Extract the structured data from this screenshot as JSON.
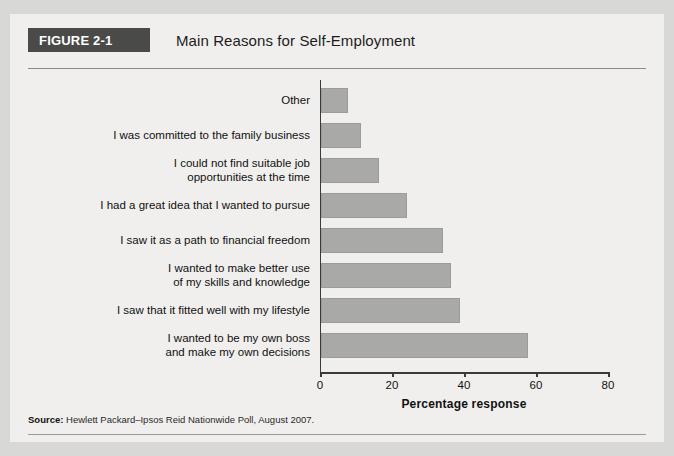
{
  "figure": {
    "badge_label": "FIGURE 2-1",
    "title": "Main Reasons for Self-Employment",
    "source_label": "Source:",
    "source_text": " Hewlett Packard–Ipsos Reid Nationwide Poll, August 2007."
  },
  "colors": {
    "badge_background": "#4a4a48",
    "badge_text": "#ffffff",
    "bar_fill": "#a9a9a7",
    "bar_border": "#9b9b99",
    "axis": "#3a3a38",
    "panel_background": "#f0efed",
    "page_background": "#d8d8d6"
  },
  "chart_data": {
    "type": "bar",
    "orientation": "horizontal",
    "title": "Main Reasons for Self-Employment",
    "xlabel": "Percentage response",
    "ylabel": "",
    "xlim": [
      0,
      80
    ],
    "xticks": [
      0,
      20,
      40,
      60,
      80
    ],
    "xtick_labels": [
      "0",
      "20",
      "40",
      "60",
      "80"
    ],
    "grid": false,
    "legend": false,
    "categories": [
      "Other",
      "I was committed to the family business",
      "I could not find suitable job\nopportunities at the time",
      "I had a great idea that I wanted to pursue",
      "I saw it as a path to financial freedom",
      "I wanted to make better use\nof my skills and knowledge",
      "I saw that it fitted well with my lifestyle",
      "I wanted to be my own boss\nand make my own decisions"
    ],
    "category_lines": [
      [
        "Other"
      ],
      [
        "I was committed to the family business"
      ],
      [
        "I could not find suitable job",
        "opportunities at the time"
      ],
      [
        "I had a great idea that I wanted to pursue"
      ],
      [
        "I saw it as a path to financial freedom"
      ],
      [
        "I wanted to make better use",
        "of my skills and knowledge"
      ],
      [
        "I saw that it fitted well with my lifestyle"
      ],
      [
        "I wanted to be my own boss",
        "and make my own decisions"
      ]
    ],
    "values": [
      7.5,
      11,
      16,
      24,
      34,
      36,
      38.5,
      57.5
    ]
  }
}
